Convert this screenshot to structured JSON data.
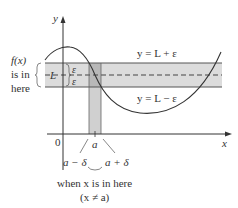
{
  "diagram": {
    "axes": {
      "y_label": "y",
      "x_label": "x",
      "origin_label": "0"
    },
    "lines": {
      "upper": "y = L + ε",
      "lower": "y = L − ε"
    },
    "band_labels": {
      "center": "L",
      "epsilon_top": "ε",
      "epsilon_bottom": "ε"
    },
    "fx_note": [
      "f(x)",
      "is in",
      "here"
    ],
    "x_marks": {
      "a": "a",
      "a_minus_delta": "a − δ",
      "a_plus_delta": "a + δ"
    },
    "x_note": [
      "when x is in here",
      "(x ≠ a)"
    ],
    "colors": {
      "band_fill": "#d9d9d9",
      "strip_fill": "#c4c4c4",
      "line": "#333333"
    }
  }
}
